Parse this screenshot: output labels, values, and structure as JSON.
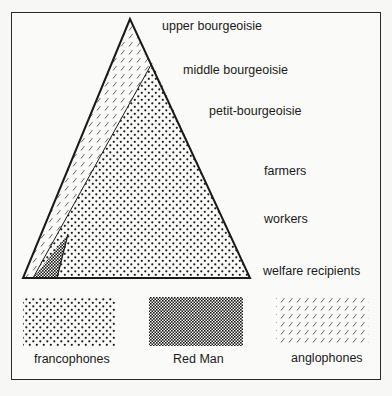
{
  "diagram": {
    "title": "",
    "class_levels": [
      {
        "label": "upper bourgeoisie"
      },
      {
        "label": "middle bourgeoisie"
      },
      {
        "label": "petit-bourgeoisie"
      },
      {
        "label": "farmers"
      },
      {
        "label": "workers"
      },
      {
        "label": "welfare recipients"
      }
    ],
    "legend": [
      {
        "label": "francophones",
        "pattern": "dots"
      },
      {
        "label": "Red Man",
        "pattern": "checker"
      },
      {
        "label": "anglophones",
        "pattern": "hatch"
      }
    ],
    "colors": {
      "ink": "#1a1a1a",
      "paper": "#fafaf8"
    }
  }
}
